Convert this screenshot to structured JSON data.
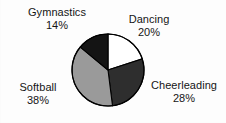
{
  "chart_data": {
    "type": "pie",
    "title": "",
    "categories": [
      "Dancing",
      "Cheerleading",
      "Softball",
      "Gymnastics"
    ],
    "values": [
      20,
      28,
      38,
      14
    ],
    "unit": "%",
    "start_angle_deg": 0,
    "direction": "clockwise",
    "legend": "none",
    "labels_position": "outside",
    "slices": [
      {
        "name": "Dancing",
        "percent": "20%",
        "value": 20,
        "color": "#ffffff",
        "label_text": "Dancing",
        "mid_angle_deg": 36
      },
      {
        "name": "Cheerleading",
        "percent": "28%",
        "value": 28,
        "color": "#2e2e2e",
        "label_text": "Cheerleading",
        "mid_angle_deg": 122.4
      },
      {
        "name": "Softball",
        "percent": "38%",
        "value": 38,
        "color": "#9a9a9a",
        "label_text": "Softball",
        "mid_angle_deg": 241.2
      },
      {
        "name": "Gymnastics",
        "percent": "14%",
        "value": 14,
        "color": "#141414",
        "label_text": "Gymnastics",
        "mid_angle_deg": 334.8
      }
    ],
    "outline_color": "#000000",
    "background_color": "#ffffff"
  },
  "labels": {
    "gymnastics": {
      "name": "Gymnastics",
      "percent": "14%"
    },
    "dancing": {
      "name": "Dancing",
      "percent": "20%"
    },
    "cheerleading": {
      "name": "Cheerleading",
      "percent": "28%"
    },
    "softball": {
      "name": "Softball",
      "percent": "38%"
    }
  }
}
